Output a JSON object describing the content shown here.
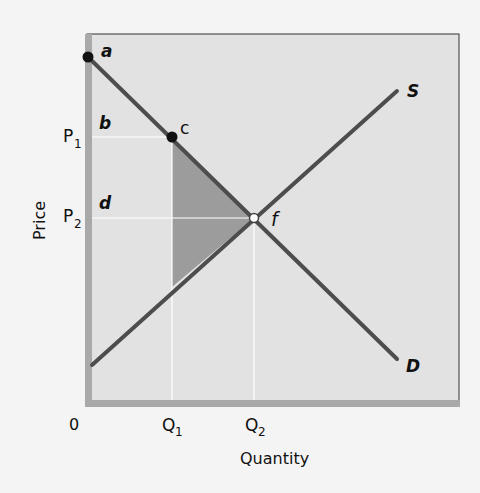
{
  "diagram": {
    "axes": {
      "ylabel": "Price",
      "xlabel": "Quantity",
      "origin": "0",
      "y_ticks": [
        {
          "label": "P",
          "sub": "1"
        },
        {
          "label": "P",
          "sub": "2"
        }
      ],
      "x_ticks": [
        {
          "label": "Q",
          "sub": "1"
        },
        {
          "label": "Q",
          "sub": "2"
        }
      ]
    },
    "curves": {
      "supply": "S",
      "demand": "D"
    },
    "points": {
      "a": "a",
      "c": "c",
      "f": "f"
    },
    "regions": {
      "b": "b",
      "d": "d"
    },
    "colors": {
      "background": "#f4f4f4",
      "plot_bg": "#e3e3e3",
      "curve": "#4d4d4d",
      "shade": "#9b9b9b",
      "axis": "#a6a6a6",
      "guide": "#ffffff"
    }
  }
}
